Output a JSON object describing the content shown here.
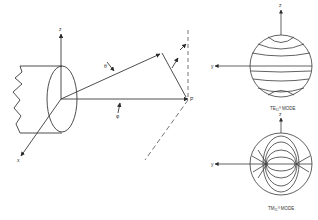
{
  "diagram": {
    "type": "waveguide-coordinate-and-mode-patterns",
    "left_figure": {
      "axis_labels": {
        "z": "z",
        "x": "x",
        "y": "y"
      },
      "angle_labels": {
        "theta": "θ",
        "phi": "φ"
      },
      "point_label": "P"
    },
    "top_mode": {
      "label": "TE₁₁⁰ MODE",
      "axis_labels": {
        "up": "z",
        "left": "y"
      }
    },
    "bottom_mode": {
      "label": "TM₁₁⁰ MODE",
      "axis_labels": {
        "up": "z",
        "left": "y"
      }
    },
    "colors": {
      "line": "#3a3a3a",
      "dash": "#666666",
      "background": "#ffffff"
    }
  }
}
